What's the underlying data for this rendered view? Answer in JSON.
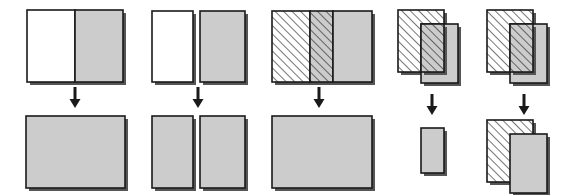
{
  "figure": {
    "colors": {
      "gray_fill": "#cccccc",
      "white_fill": "#ffffff",
      "outline": "#1a1a1a",
      "hatch_line": "#1a1a1a",
      "shadow": "#555555",
      "background": "#ffffff"
    },
    "hatch": {
      "name": "diagonal-hatch-45",
      "direction": "lower-left-to-upper-right",
      "spacing_px": 6,
      "line_width_px": 1.2
    },
    "arrow": {
      "name": "down-arrow",
      "direction": "down",
      "shaft_width_px": 3,
      "head_width_px": 11,
      "head_height_px": 9
    },
    "groups": [
      {
        "id": "group-1",
        "label": "adjacent-touching-white-and-gray",
        "arrow": {
          "x": 75,
          "y_top": 87,
          "y_bottom": 108
        },
        "input_shapes": [
          {
            "name": "white-rect-left",
            "fill": "white",
            "hatched": false,
            "x": 27,
            "y": 10,
            "w": 48,
            "h": 72
          },
          {
            "name": "gray-rect-right",
            "fill": "gray",
            "hatched": false,
            "x": 75,
            "y": 10,
            "w": 48,
            "h": 72
          }
        ],
        "result_shapes": [
          {
            "name": "merged-gray-rect",
            "fill": "gray",
            "hatched": false,
            "x": 26,
            "y": 116,
            "w": 99,
            "h": 72
          }
        ]
      },
      {
        "id": "group-2",
        "label": "separated-white-and-gray",
        "arrow": {
          "x": 198,
          "y_top": 87,
          "y_bottom": 108
        },
        "input_shapes": [
          {
            "name": "white-rect-left",
            "fill": "white",
            "hatched": false,
            "x": 152,
            "y": 11,
            "w": 41,
            "h": 71
          },
          {
            "name": "gray-rect-right",
            "fill": "gray",
            "hatched": false,
            "x": 200,
            "y": 11,
            "w": 45,
            "h": 71
          }
        ],
        "result_shapes": [
          {
            "name": "gray-rect-left",
            "fill": "gray",
            "hatched": false,
            "x": 152,
            "y": 116,
            "w": 41,
            "h": 72
          },
          {
            "name": "gray-rect-right",
            "fill": "gray",
            "hatched": false,
            "x": 200,
            "y": 116,
            "w": 45,
            "h": 72
          }
        ]
      },
      {
        "id": "group-3",
        "label": "overlapping-hatched-and-gray-bands",
        "arrow": {
          "x": 319,
          "y_top": 87,
          "y_bottom": 108
        },
        "input_shapes": [
          {
            "name": "hatched-rect-left",
            "fill": "white",
            "hatched": true,
            "x": 272,
            "y": 11,
            "w": 38,
            "h": 71
          },
          {
            "name": "hatched-gray-overlap-band",
            "fill": "gray",
            "hatched": true,
            "x": 310,
            "y": 11,
            "w": 23,
            "h": 71
          },
          {
            "name": "gray-rect-right",
            "fill": "gray",
            "hatched": false,
            "x": 333,
            "y": 11,
            "w": 39,
            "h": 71
          }
        ],
        "result_shapes": [
          {
            "name": "merged-gray-rect",
            "fill": "gray",
            "hatched": false,
            "x": 272,
            "y": 116,
            "w": 100,
            "h": 72
          }
        ]
      },
      {
        "id": "group-4",
        "label": "offset-overlap-intersection",
        "arrow": {
          "x": 432,
          "y_top": 94,
          "y_bottom": 115
        },
        "input_shapes": [
          {
            "name": "hatched-rect-back",
            "fill": "white",
            "hatched": true,
            "x": 398,
            "y": 10,
            "w": 46,
            "h": 62
          },
          {
            "name": "gray-rect-front",
            "fill": "gray",
            "hatched": false,
            "x": 421,
            "y": 24,
            "w": 37,
            "h": 59
          },
          {
            "name": "hatched-intersection-band",
            "fill": "gray",
            "hatched": true,
            "x": 421,
            "y": 24,
            "w": 23,
            "h": 48
          }
        ],
        "result_shapes": [
          {
            "name": "intersection-gray-rect",
            "fill": "gray",
            "hatched": false,
            "x": 421,
            "y": 128,
            "w": 23,
            "h": 45
          }
        ]
      },
      {
        "id": "group-5",
        "label": "offset-overlap-union-stacked",
        "arrow": {
          "x": 524,
          "y_top": 94,
          "y_bottom": 115
        },
        "input_shapes": [
          {
            "name": "hatched-rect-back",
            "fill": "white",
            "hatched": true,
            "x": 487,
            "y": 10,
            "w": 46,
            "h": 62
          },
          {
            "name": "gray-rect-front",
            "fill": "gray",
            "hatched": false,
            "x": 510,
            "y": 24,
            "w": 37,
            "h": 59
          },
          {
            "name": "hatched-intersection-band",
            "fill": "gray",
            "hatched": true,
            "x": 510,
            "y": 24,
            "w": 23,
            "h": 48
          }
        ],
        "result_shapes": [
          {
            "name": "hatched-rect-back",
            "fill": "white",
            "hatched": true,
            "x": 487,
            "y": 120,
            "w": 46,
            "h": 62
          },
          {
            "name": "gray-rect-front",
            "fill": "gray",
            "hatched": false,
            "x": 510,
            "y": 134,
            "w": 37,
            "h": 59
          }
        ]
      }
    ]
  }
}
